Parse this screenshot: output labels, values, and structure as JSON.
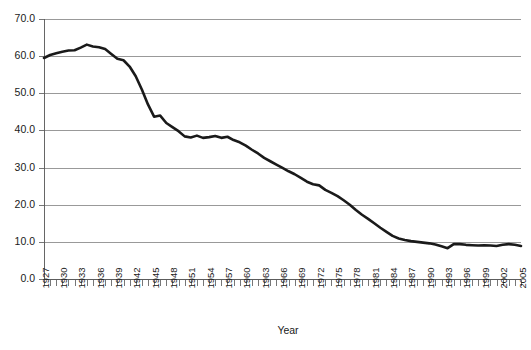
{
  "chart_data": {
    "type": "line",
    "title": "",
    "subtitle": "",
    "xlabel": "Year",
    "ylabel": "",
    "grid": true,
    "legend": false,
    "legend_position": "none",
    "xlim": [
      1927,
      2005
    ],
    "ylim": [
      0.0,
      70.0
    ],
    "ytick_labels": [
      "0.0",
      "10.0",
      "20.0",
      "30.0",
      "40.0",
      "50.0",
      "60.0",
      "70.0"
    ],
    "ytick_values": [
      0.0,
      10.0,
      20.0,
      30.0,
      40.0,
      50.0,
      60.0,
      70.0
    ],
    "xtick_labels": [
      "1927",
      "1930",
      "1933",
      "1936",
      "1939",
      "1942",
      "1945",
      "1948",
      "1951",
      "1954",
      "1957",
      "1960",
      "1963",
      "1966",
      "1969",
      "1972",
      "1975",
      "1978",
      "1981",
      "1984",
      "1987",
      "1990",
      "1993",
      "1996",
      "1999",
      "2002",
      "2005"
    ],
    "xtick_step_years": 3,
    "minor_tick_step_years": 1,
    "series_color": "#1a1a1a",
    "series": [
      {
        "name": "rate",
        "x": [
          1927,
          1928,
          1929,
          1930,
          1931,
          1932,
          1933,
          1934,
          1935,
          1936,
          1937,
          1938,
          1939,
          1940,
          1941,
          1942,
          1943,
          1944,
          1945,
          1946,
          1947,
          1948,
          1949,
          1950,
          1951,
          1952,
          1953,
          1954,
          1955,
          1956,
          1957,
          1958,
          1959,
          1960,
          1961,
          1962,
          1963,
          1964,
          1965,
          1966,
          1967,
          1968,
          1969,
          1970,
          1971,
          1972,
          1973,
          1974,
          1975,
          1976,
          1977,
          1978,
          1979,
          1980,
          1981,
          1982,
          1983,
          1984,
          1985,
          1986,
          1987,
          1988,
          1989,
          1990,
          1991,
          1992,
          1993,
          1994,
          1995,
          1996,
          1997,
          1998,
          1999,
          2000,
          2001,
          2002,
          2003,
          2004,
          2005
        ],
        "values": [
          59.5,
          60.3,
          60.8,
          61.2,
          61.5,
          61.6,
          62.3,
          63.1,
          62.6,
          62.4,
          61.9,
          60.6,
          59.3,
          58.9,
          57.2,
          54.6,
          51.0,
          47.0,
          43.7,
          44.0,
          42.0,
          40.9,
          39.8,
          38.4,
          38.1,
          38.6,
          38.0,
          38.2,
          38.5,
          38.0,
          38.3,
          37.4,
          36.8,
          35.9,
          34.8,
          33.8,
          32.6,
          31.7,
          30.8,
          29.9,
          29.0,
          28.2,
          27.2,
          26.2,
          25.5,
          25.2,
          24.0,
          23.2,
          22.3,
          21.2,
          20.0,
          18.6,
          17.3,
          16.2,
          15.0,
          13.8,
          12.7,
          11.6,
          10.9,
          10.5,
          10.2,
          10.0,
          9.8,
          9.6,
          9.3,
          8.8,
          8.3,
          9.4,
          9.4,
          9.2,
          9.1,
          9.0,
          9.1,
          9.0,
          8.9,
          9.2,
          9.4,
          9.2,
          8.9
        ]
      }
    ]
  },
  "axis": {
    "x_title": "Year"
  }
}
